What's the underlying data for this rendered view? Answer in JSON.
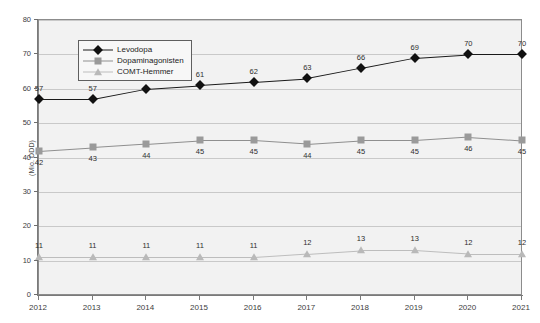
{
  "chart_data": {
    "type": "line",
    "title": "",
    "xlabel": "",
    "ylabel": "(Mio. DDD)",
    "categories": [
      "2012",
      "2013",
      "2014",
      "2015",
      "2016",
      "2017",
      "2018",
      "2019",
      "2020",
      "2021"
    ],
    "series": [
      {
        "name": "Levodopa",
        "values": [
          57,
          57,
          60,
          61,
          62,
          63,
          66,
          69,
          70,
          70
        ]
      },
      {
        "name": "Dopaminagonisten",
        "values": [
          42,
          43,
          44,
          45,
          45,
          44,
          45,
          45,
          46,
          45
        ]
      },
      {
        "name": "COMT-Hemmer",
        "values": [
          11,
          11,
          11,
          11,
          11,
          12,
          13,
          13,
          12,
          12
        ]
      }
    ],
    "ylim": [
      0,
      80
    ],
    "yticks": [
      0,
      10,
      20,
      30,
      40,
      50,
      60,
      70,
      80
    ],
    "grid": true,
    "legend_position": "top-left",
    "colors": {
      "levodopa": "#1a1a1a",
      "dopaminagonisten": "#8f8f8f",
      "comt_hemmer": "#bdbdbd",
      "plot_background": "#f2f2f2",
      "gridline": "#c9c9c9",
      "axis": "#7a7a7a"
    },
    "markers": {
      "levodopa": "diamond",
      "dopaminagonisten": "square",
      "comt_hemmer": "triangle"
    },
    "data_label_placement": {
      "levodopa": "above",
      "dopaminagonisten": "below",
      "comt_hemmer": "above"
    }
  }
}
